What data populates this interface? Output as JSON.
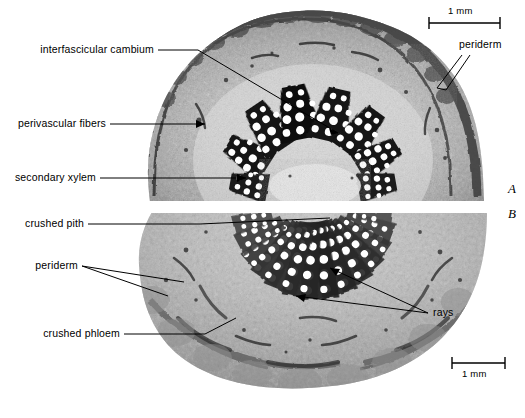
{
  "figure": {
    "type": "light-micrograph",
    "width": 525,
    "height": 418,
    "background_color": "#ffffff",
    "ink_color": "#000000"
  },
  "panels": [
    {
      "id": "A",
      "letter": "A",
      "position": "upper",
      "description": "upper stem cross section with wedge-shaped vascular bundles"
    },
    {
      "id": "B",
      "letter": "B",
      "position": "lower",
      "description": "lower stem cross section with numerous radial vascular bundles"
    }
  ],
  "labels": {
    "interfascicular_cambium": "interfascicular cambium",
    "perivascular_fibers": "perivascular fibers",
    "secondary_xylem": "secondary xylem",
    "crushed_pith": "crushed pith",
    "periderm_left": "periderm",
    "periderm_right": "periderm",
    "crushed_phloem": "crushed phloem",
    "rays": "rays"
  },
  "scale_bars": [
    {
      "id": "top",
      "label": "1 mm",
      "label_position": "above"
    },
    {
      "id": "bottom",
      "label": "1 mm",
      "label_position": "below"
    }
  ]
}
